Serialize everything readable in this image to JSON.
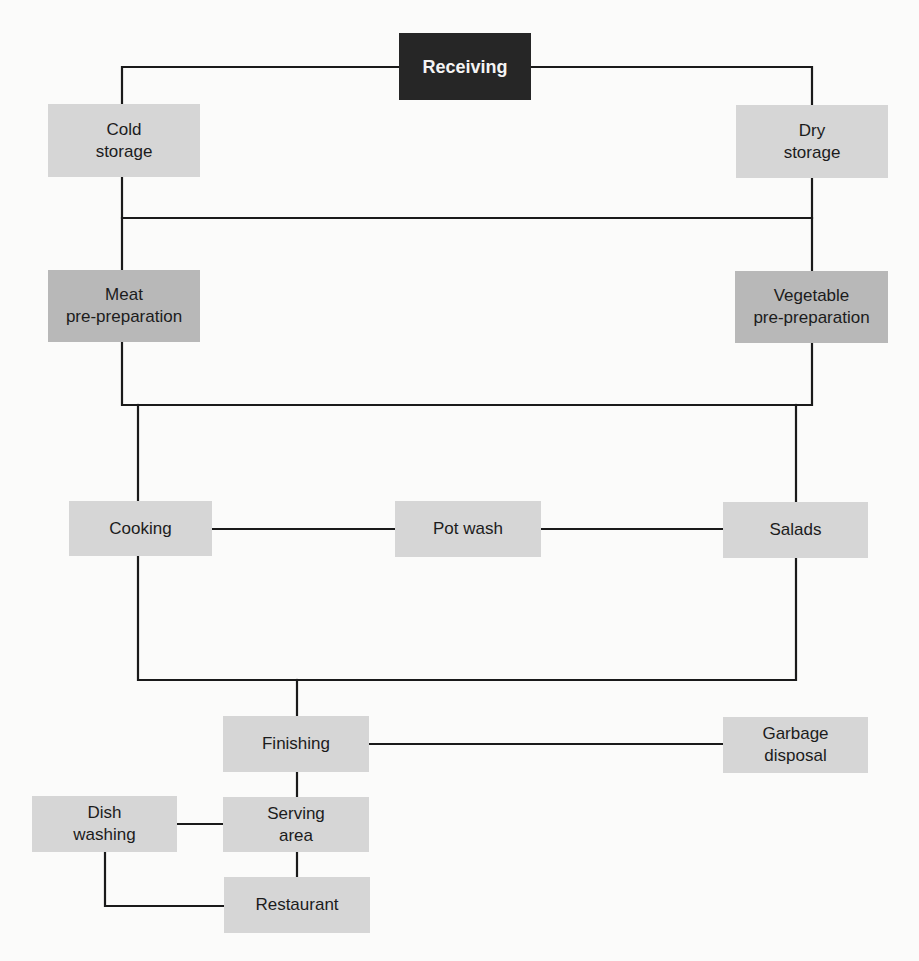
{
  "diagram": {
    "type": "flowchart",
    "colors": {
      "background": "#fbfbfa",
      "start_node": "#262626",
      "start_text": "#f4f4f4",
      "node_light": "#d6d6d6",
      "node_mid": "#b8b8b8",
      "line": "#1a1a1a",
      "text": "#1c1c1c"
    },
    "nodes": {
      "receiving": {
        "label": "Receiving"
      },
      "cold_storage": {
        "label": "Cold\nstorage"
      },
      "dry_storage": {
        "label": "Dry\nstorage"
      },
      "meat_prep": {
        "label": "Meat\npre-preparation"
      },
      "vegetable_prep": {
        "label": "Vegetable\npre-preparation"
      },
      "cooking": {
        "label": "Cooking"
      },
      "pot_wash": {
        "label": "Pot wash"
      },
      "salads": {
        "label": "Salads"
      },
      "finishing": {
        "label": "Finishing"
      },
      "garbage_disposal": {
        "label": "Garbage\ndisposal"
      },
      "dish_washing": {
        "label": "Dish\nwashing"
      },
      "serving_area": {
        "label": "Serving\narea"
      },
      "restaurant": {
        "label": "Restaurant"
      }
    },
    "edges": [
      {
        "from": "Receiving",
        "to": "Cold storage"
      },
      {
        "from": "Receiving",
        "to": "Dry storage"
      },
      {
        "from": "Cold storage",
        "to": "Meat pre-preparation"
      },
      {
        "from": "Dry storage",
        "to": "Vegetable pre-preparation"
      },
      {
        "from": "Cold storage",
        "to": "Dry storage"
      },
      {
        "from": "Meat pre-preparation",
        "to": "Cooking"
      },
      {
        "from": "Vegetable pre-preparation",
        "to": "Salads"
      },
      {
        "from": "Cooking",
        "to": "Pot wash"
      },
      {
        "from": "Pot wash",
        "to": "Salads"
      },
      {
        "from": "Cooking",
        "to": "Finishing"
      },
      {
        "from": "Salads",
        "to": "Finishing"
      },
      {
        "from": "Finishing",
        "to": "Garbage disposal"
      },
      {
        "from": "Finishing",
        "to": "Serving area"
      },
      {
        "from": "Serving area",
        "to": "Dish washing"
      },
      {
        "from": "Serving area",
        "to": "Restaurant"
      },
      {
        "from": "Dish washing",
        "to": "Restaurant"
      }
    ]
  }
}
